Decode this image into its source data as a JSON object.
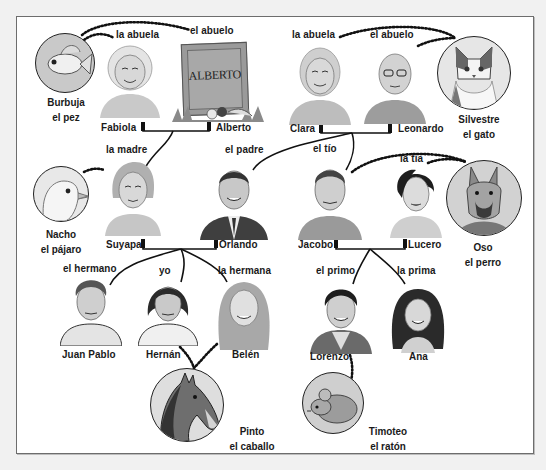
{
  "diagram": {
    "type": "family-tree",
    "language": "Spanish",
    "generations": [
      {
        "level": "grandparents",
        "couples": [
          {
            "partners": [
              {
                "name": "Fabiola",
                "role": "la abuela"
              },
              {
                "name": "Alberto",
                "role": "el abuelo",
                "note": "deceased (tombstone)",
                "tombstone_text": "ALBERTO"
              }
            ]
          },
          {
            "partners": [
              {
                "name": "Clara",
                "role": "la abuela"
              },
              {
                "name": "Leonardo",
                "role": "el abuelo"
              }
            ]
          }
        ]
      },
      {
        "level": "parents",
        "couples": [
          {
            "partners": [
              {
                "name": "Suyapa",
                "role": "la madre"
              },
              {
                "name": "Orlando",
                "role": "el padre"
              }
            ]
          },
          {
            "partners": [
              {
                "name": "Jacobo",
                "role": "el tío"
              },
              {
                "name": "Lucero",
                "role": "la tía"
              }
            ]
          }
        ]
      },
      {
        "level": "children",
        "members": [
          {
            "name": "Juan Pablo",
            "role": "el hermano"
          },
          {
            "name": "Hernán",
            "role": "yo"
          },
          {
            "name": "Belén",
            "role": "la hermana"
          },
          {
            "name": "Lorenzo",
            "role": "el primo"
          },
          {
            "name": "Ana",
            "role": "la prima"
          }
        ]
      }
    ],
    "pets": [
      {
        "name": "Burbuja",
        "kind": "el pez",
        "owner": "Fabiola"
      },
      {
        "name": "Silvestre",
        "kind": "el gato",
        "owner": "Clara & Leonardo"
      },
      {
        "name": "Nacho",
        "kind": "el pájaro",
        "owner": "Suyapa"
      },
      {
        "name": "Oso",
        "kind": "el perro",
        "owner": "Jacobo & Lucero"
      },
      {
        "name": "Pinto",
        "kind": "el caballo",
        "owner": "Hernán & Belén"
      },
      {
        "name": "Timoteo",
        "kind": "el ratón",
        "owner": "Lorenzo"
      }
    ],
    "edges": [
      {
        "from": "Fabiola+Alberto",
        "to": "Suyapa",
        "style": "solid"
      },
      {
        "from": "Clara+Leonardo",
        "to": "Orlando",
        "style": "solid"
      },
      {
        "from": "Clara+Leonardo",
        "to": "Jacobo",
        "style": "solid"
      },
      {
        "from": "Suyapa+Orlando",
        "to": "Juan Pablo",
        "style": "solid"
      },
      {
        "from": "Suyapa+Orlando",
        "to": "Hernán",
        "style": "solid"
      },
      {
        "from": "Suyapa+Orlando",
        "to": "Belén",
        "style": "solid"
      },
      {
        "from": "Jacobo+Lucero",
        "to": "Lorenzo",
        "style": "solid"
      },
      {
        "from": "Jacobo+Lucero",
        "to": "Ana",
        "style": "solid"
      }
    ]
  },
  "labels": {
    "fabiola_role": "la abuela",
    "alberto_role": "el abuelo",
    "clara_role": "la abuela",
    "leonardo_role": "el abuelo",
    "suyapa_role": "la madre",
    "orlando_role": "el padre",
    "jacobo_role": "el tío",
    "lucero_role": "la tía",
    "juanpablo_role": "el hermano",
    "hernan_role": "yo",
    "belen_role": "la hermana",
    "lorenzo_role": "el primo",
    "ana_role": "la prima",
    "fabiola": "Fabiola",
    "alberto": "Alberto",
    "clara": "Clara",
    "leonardo": "Leonardo",
    "suyapa": "Suyapa",
    "orlando": "Orlando",
    "jacobo": "Jacobo",
    "lucero": "Lucero",
    "juanpablo": "Juan Pablo",
    "hernan": "Hernán",
    "belen": "Belén",
    "lorenzo": "Lorenzo",
    "ana": "Ana",
    "tombstone": "ALBERTO",
    "burbuja_name": "Burbuja",
    "burbuja_kind": "el pez",
    "silvestre_name": "Silvestre",
    "silvestre_kind": "el gato",
    "nacho_name": "Nacho",
    "nacho_kind": "el pájaro",
    "oso_name": "Oso",
    "oso_kind": "el perro",
    "pinto_name": "Pinto",
    "pinto_kind": "el caballo",
    "timoteo_name": "Timoteo",
    "timoteo_kind": "el ratón"
  },
  "colors": {
    "page_bg": "#f1f1f1",
    "frame_bg": "#ffffff",
    "frame_border": "#6d6d6d",
    "line": "#111111",
    "text": "#1a1a1a"
  }
}
